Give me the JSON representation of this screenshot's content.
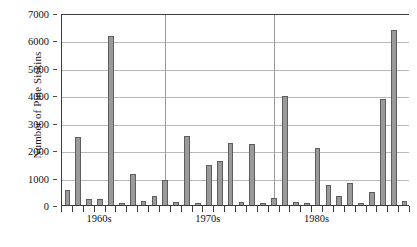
{
  "chart_data": {
    "type": "bar",
    "title": "",
    "xlabel": "",
    "ylabel": "Number of Pine Siskins",
    "ylim": [
      0,
      7000
    ],
    "ytick_labels": [
      "0",
      "1000",
      "2000",
      "3000",
      "4000",
      "5000",
      "6000",
      "7000"
    ],
    "ytick_values": [
      0,
      1000,
      2000,
      3000,
      4000,
      5000,
      6000,
      7000
    ],
    "grid": "horizontal-gridlines-plus-decade-separators",
    "legend": "none",
    "bar_color": "#9a9a9a",
    "bar_edge_color": "#5e5e5e",
    "axis_color": "#3b3b3b",
    "gridline_color": "#b9b9b9",
    "categories": [
      "1957",
      "1958",
      "1959",
      "1960",
      "1961",
      "1962",
      "1963",
      "1964",
      "1965",
      "1966",
      "1967",
      "1968",
      "1969",
      "1970",
      "1971",
      "1972",
      "1973",
      "1974",
      "1975",
      "1976",
      "1977",
      "1978",
      "1979",
      "1980",
      "1981",
      "1982",
      "1983",
      "1984",
      "1985",
      "1986",
      "1987",
      "1988"
    ],
    "values": [
      600,
      2500,
      250,
      250,
      6200,
      100,
      1150,
      200,
      350,
      950,
      150,
      2550,
      100,
      1500,
      1650,
      2300,
      150,
      2250,
      100,
      300,
      4000,
      150,
      100,
      2100,
      750,
      350,
      850,
      100,
      500,
      3900,
      6400,
      200
    ],
    "decade_labels": [
      "1960s",
      "1970s",
      "1980s"
    ],
    "decade_label_positions": [
      3.5,
      13.5,
      23.5
    ],
    "decade_separator_positions": [
      9.5,
      19.5
    ]
  }
}
